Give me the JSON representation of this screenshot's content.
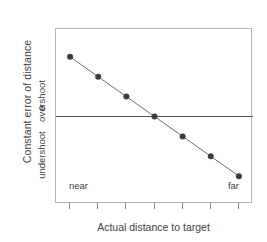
{
  "chart_data": {
    "type": "line",
    "title": "",
    "subtitle": "",
    "xlabel": "Actual distance to target",
    "ylabel": "Constant error of distance",
    "x": [
      1,
      2,
      3,
      4,
      5,
      6,
      7
    ],
    "values": [
      3,
      2,
      1,
      0,
      -1,
      -2,
      -3
    ],
    "series": [
      {
        "name": "constant error",
        "values": [
          3,
          2,
          1,
          0,
          -1,
          -2,
          -3
        ]
      }
    ],
    "xtick_labels": [
      "near",
      "",
      "",
      "",
      "",
      "",
      "far"
    ],
    "ytick_labels": [
      "overshoot",
      "0",
      "undershoot"
    ],
    "ytick_values": [
      3.2,
      0,
      -3.2
    ],
    "xlim": [
      0.5,
      7.5
    ],
    "ylim": [
      -4.4,
      4.4
    ],
    "grid": false,
    "legend": "none",
    "annotations": [
      {
        "text": "near",
        "position": "bottom-left-inside-plot"
      },
      {
        "text": "far",
        "position": "bottom-right-inside-plot"
      }
    ],
    "zero_line": {
      "value": 0,
      "orientation": "horizontal",
      "color": "#555555"
    },
    "marker": {
      "shape": "filled-circle",
      "color": "#3c3c3c",
      "size": 6
    },
    "line": {
      "color": "#6e6e6e",
      "width": 1
    }
  },
  "axes": {
    "y_title": "Constant error of distance",
    "y_ticks": {
      "overshoot": "overshoot",
      "zero": "0",
      "undershoot": "undershoot"
    },
    "x_title": "Actual distance to target",
    "x_range": {
      "near": "near",
      "far": "far"
    }
  },
  "colors": {
    "frame": "#b4b4b4",
    "zero_line": "#555555",
    "marker": "#3c3c3c",
    "line": "#6e6e6e",
    "text": "#3f3f3f",
    "background": "#ffffff"
  }
}
